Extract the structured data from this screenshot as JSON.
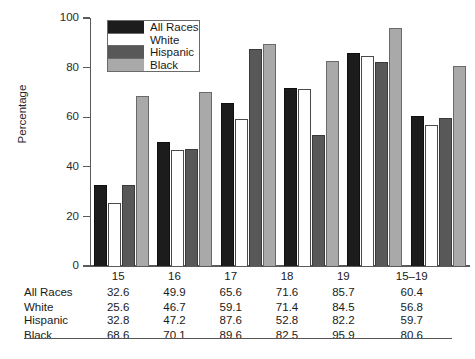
{
  "chart_data": {
    "type": "bar",
    "title": "",
    "xlabel": "",
    "ylabel": "Percentage",
    "ylim": [
      0,
      100
    ],
    "yticks": [
      0,
      20,
      40,
      60,
      80,
      100
    ],
    "grid": false,
    "legend_position": "top-left-inside",
    "categories": [
      "15",
      "16",
      "17",
      "18",
      "19",
      "15–19"
    ],
    "series": [
      {
        "name": "All Races",
        "color": "#1c1c1c",
        "values": [
          32.6,
          49.9,
          65.6,
          71.6,
          85.7,
          60.4
        ]
      },
      {
        "name": "White",
        "color": "#ffffff",
        "values": [
          25.6,
          46.7,
          59.1,
          71.4,
          84.5,
          56.8
        ]
      },
      {
        "name": "Hispanic",
        "color": "#585858",
        "values": [
          32.8,
          47.2,
          87.6,
          52.8,
          82.2,
          59.7
        ]
      },
      {
        "name": "Black",
        "color": "#a9a9a9",
        "values": [
          68.6,
          70.1,
          89.6,
          82.5,
          95.9,
          80.6
        ]
      }
    ]
  },
  "axis": {
    "y_title": "Percentage",
    "y_ticks": [
      "100",
      "80",
      "60",
      "40",
      "20",
      "0"
    ]
  },
  "legend": {
    "items": [
      {
        "label": "All Races"
      },
      {
        "label": "White"
      },
      {
        "label": "Hispanic"
      },
      {
        "label": "Black"
      }
    ]
  },
  "table": {
    "corner": "",
    "headers": [
      "15",
      "16",
      "17",
      "18",
      "19",
      "15–19"
    ],
    "rows": [
      {
        "label": "All Races",
        "values": [
          "32.6",
          "49.9",
          "65.6",
          "71.6",
          "85.7",
          "60.4"
        ]
      },
      {
        "label": "White",
        "values": [
          "25.6",
          "46.7",
          "59.1",
          "71.4",
          "84.5",
          "56.8"
        ]
      },
      {
        "label": "Hispanic",
        "values": [
          "32.8",
          "47.2",
          "87.6",
          "52.8",
          "82.2",
          "59.7"
        ]
      },
      {
        "label": "Black",
        "values": [
          "68.6",
          "70.1",
          "89.6",
          "82.5",
          "95.9",
          "80.6"
        ]
      }
    ]
  }
}
